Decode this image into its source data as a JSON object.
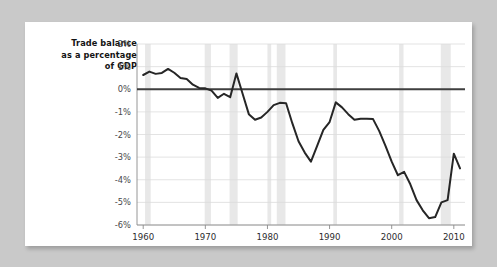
{
  "figure": {
    "panel_background": "#ffffff",
    "outer_background": "#c9c9c9"
  },
  "chart_data": {
    "type": "line",
    "title": "",
    "subtitle": "",
    "xlabel": "",
    "ylabel": "Trade balance as a percentage of GDP",
    "ylabel_lines": [
      "Trade balance",
      "as a percentage",
      "of GDP"
    ],
    "xlim": [
      1959.0,
      2011.8
    ],
    "ylim": [
      -6,
      2
    ],
    "grid": true,
    "grid_color": "#dcdcdc",
    "legend": null,
    "legend_position": "none",
    "line_color": "#262626",
    "zero_line_color": "#3f3f3f",
    "recession_band_color": "#e8e8e8",
    "xticks": [
      1960,
      1970,
      1980,
      1990,
      2000,
      2010
    ],
    "xtick_labels": [
      "1960",
      "1970",
      "1980",
      "1990",
      "2000",
      "2010"
    ],
    "yticks": [
      2,
      1,
      0,
      -1,
      -2,
      -3,
      -4,
      -5,
      -6
    ],
    "ytick_labels": [
      "2%",
      "1%",
      "0%",
      "-1%",
      "-2%",
      "-3%",
      "-4%",
      "-5%",
      "-6%"
    ],
    "recession_bands": [
      {
        "start": 1960.3,
        "end": 1961.2
      },
      {
        "start": 1969.9,
        "end": 1970.9
      },
      {
        "start": 1973.9,
        "end": 1975.2
      },
      {
        "start": 1980.0,
        "end": 1980.6
      },
      {
        "start": 1981.5,
        "end": 1982.9
      },
      {
        "start": 1990.6,
        "end": 1991.2
      },
      {
        "start": 2001.2,
        "end": 2001.9
      },
      {
        "start": 2007.9,
        "end": 2009.5
      }
    ],
    "series": [
      {
        "name": "Trade balance as a percentage of GDP",
        "x": [
          1960,
          1961,
          1962,
          1963,
          1964,
          1965,
          1966,
          1967,
          1968,
          1969,
          1970,
          1971,
          1972,
          1973,
          1974,
          1975,
          1976,
          1977,
          1978,
          1979,
          1980,
          1981,
          1982,
          1983,
          1984,
          1985,
          1986,
          1987,
          1988,
          1989,
          1990,
          1991,
          1992,
          1993,
          1994,
          1995,
          1996,
          1997,
          1998,
          1999,
          2000,
          2001,
          2002,
          2003,
          2004,
          2005,
          2006,
          2007,
          2008,
          2009,
          2010,
          2011
        ],
        "values": [
          0.63,
          0.78,
          0.68,
          0.72,
          0.9,
          0.73,
          0.5,
          0.45,
          0.2,
          0.06,
          0.04,
          -0.06,
          -0.38,
          -0.2,
          -0.35,
          0.7,
          -0.2,
          -1.1,
          -1.35,
          -1.25,
          -1.0,
          -0.7,
          -0.6,
          -0.62,
          -1.5,
          -2.3,
          -2.8,
          -3.2,
          -2.5,
          -1.8,
          -1.45,
          -0.58,
          -0.8,
          -1.1,
          -1.35,
          -1.3,
          -1.3,
          -1.32,
          -1.85,
          -2.5,
          -3.2,
          -3.8,
          -3.65,
          -4.2,
          -4.9,
          -5.35,
          -5.7,
          -5.65,
          -5.0,
          -4.9,
          -2.85,
          -3.5
        ]
      }
    ]
  }
}
